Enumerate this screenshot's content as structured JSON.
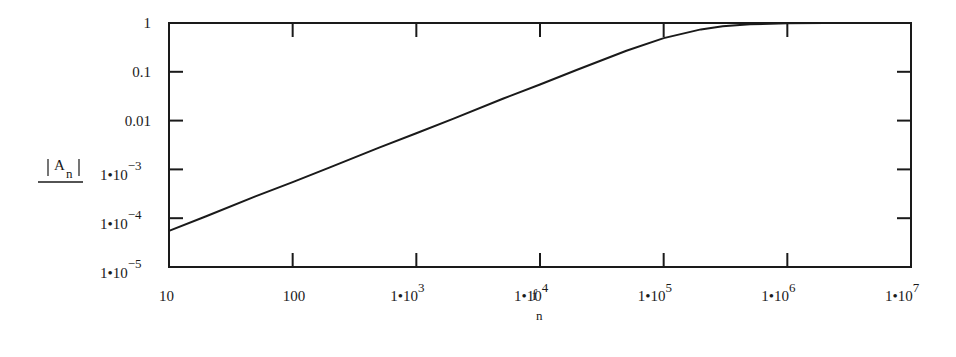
{
  "chart_data": {
    "type": "line",
    "title": "",
    "xlabel": "f_n",
    "ylabel": "|A_n|",
    "xscale": "log",
    "yscale": "log",
    "xlim": [
      10,
      10000000
    ],
    "ylim": [
      1e-05,
      1
    ],
    "grid": false,
    "legend": null,
    "x_ticks": [
      {
        "value": 10,
        "label": "10"
      },
      {
        "value": 100,
        "label": "100"
      },
      {
        "value": 1000,
        "label": "1•10",
        "exp": "3"
      },
      {
        "value": 10000,
        "label": "1•10",
        "exp": "4"
      },
      {
        "value": 100000,
        "label": "1•10",
        "exp": "5"
      },
      {
        "value": 1000000,
        "label": "1•10",
        "exp": "6"
      },
      {
        "value": 10000000,
        "label": "1•10",
        "exp": "7"
      }
    ],
    "y_ticks": [
      {
        "value": 1,
        "label": "1"
      },
      {
        "value": 0.1,
        "label": "0.1"
      },
      {
        "value": 0.01,
        "label": "0.01"
      },
      {
        "value": 0.001,
        "label": "1•10",
        "exp": "−3"
      },
      {
        "value": 0.0001,
        "label": "1•10",
        "exp": "−4"
      },
      {
        "value": 1e-05,
        "label": "1•10",
        "exp": "−5"
      }
    ],
    "series": [
      {
        "name": "|A_n|",
        "x": [
          10,
          20,
          50,
          100,
          200,
          500,
          1000,
          2000,
          5000,
          10000,
          20000,
          50000,
          100000,
          200000,
          300000,
          500000,
          1000000,
          2000000,
          5000000,
          10000000
        ],
        "values": [
          5.5e-05,
          0.00011,
          0.00028,
          0.00055,
          0.0011,
          0.0028,
          0.0055,
          0.011,
          0.028,
          0.055,
          0.11,
          0.27,
          0.49,
          0.74,
          0.86,
          0.94,
          0.985,
          0.996,
          0.999,
          1.0
        ]
      }
    ]
  },
  "labels": {
    "y_axis_symbol": "A",
    "y_axis_sub": "n",
    "x_axis_symbol": "f",
    "x_axis_sub": "n"
  }
}
